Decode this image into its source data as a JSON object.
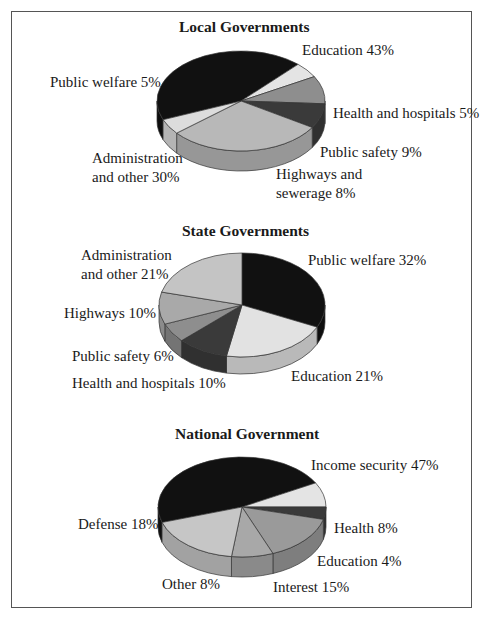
{
  "chart_data": [
    {
      "type": "pie",
      "title": "Local Governments",
      "categories": [
        "Education",
        "Health and hospitals",
        "Public safety",
        "Highways and sewerage",
        "Administration and other",
        "Public welfare"
      ],
      "values": [
        43,
        5,
        9,
        8,
        30,
        5
      ],
      "colors": [
        "#111111",
        "#e4e4e4",
        "#8e8e8e",
        "#3a3a3a",
        "#b8b8b8",
        "#dcdcdc"
      ],
      "labels": [
        "Education 43%",
        "Health and hospitals 5%",
        "Public safety 9%",
        "Highways and\nsewerage 8%",
        "Administration\nand other 30%",
        "Public welfare 5%"
      ],
      "geometry": {
        "cx": 241,
        "cy": 101,
        "rx": 84,
        "ry": 50,
        "depth": 20,
        "start_deg": 158
      }
    },
    {
      "type": "pie",
      "title": "State Governments",
      "categories": [
        "Public welfare",
        "Education",
        "Health and hospitals",
        "Public safety",
        "Highways",
        "Administration and other"
      ],
      "values": [
        32,
        21,
        10,
        6,
        10,
        21
      ],
      "colors": [
        "#111111",
        "#e2e2e2",
        "#3a3a3a",
        "#8e8e8e",
        "#a9a9a9",
        "#c4c4c4"
      ],
      "labels": [
        "Public welfare 32%",
        "Education 21%",
        "Health and hospitals 10%",
        "Public safety 6%",
        "Highways 10%",
        "Administration\nand other 21%"
      ],
      "geometry": {
        "cx": 242,
        "cy": 305,
        "rx": 83,
        "ry": 52,
        "depth": 17,
        "start_deg": 270
      }
    },
    {
      "type": "pie",
      "title": "National Government",
      "categories": [
        "Income security",
        "Health",
        "Education",
        "Interest",
        "Other",
        "Defense"
      ],
      "values": [
        47,
        8,
        4,
        15,
        8,
        18
      ],
      "colors": [
        "#111111",
        "#e4e4e4",
        "#3a3a3a",
        "#9a9a9a",
        "#a8a8a8",
        "#c6c6c6"
      ],
      "labels": [
        "Income security 47%",
        "Health 8%",
        "Education 4%",
        "Interest 15%",
        "Other 8%",
        "Defense 18%"
      ],
      "geometry": {
        "cx": 242,
        "cy": 507,
        "rx": 84,
        "ry": 50,
        "depth": 20,
        "start_deg": 162
      }
    }
  ],
  "titles": {
    "local": "Local Governments",
    "state": "State Governments",
    "national": "National Government"
  },
  "labels": {
    "local": {
      "education": "Education 43%",
      "public_welfare": "Public welfare 5%",
      "health": "Health and hospitals 5%",
      "public_safety": "Public safety 9%",
      "admin_1": "Administration",
      "admin_2": "and other 30%",
      "highways_1": "Highways and",
      "highways_2": "sewerage 8%"
    },
    "state": {
      "admin_1": "Administration",
      "admin_2": "and other 21%",
      "public_welfare": "Public welfare 32%",
      "highways": "Highways 10%",
      "public_safety": "Public safety 6%",
      "health": "Health and hospitals 10%",
      "education": "Education 21%"
    },
    "national": {
      "income": "Income security 47%",
      "health": "Health 8%",
      "defense": "Defense 18%",
      "education": "Education 4%",
      "other": "Other 8%",
      "interest": "Interest 15%"
    }
  }
}
